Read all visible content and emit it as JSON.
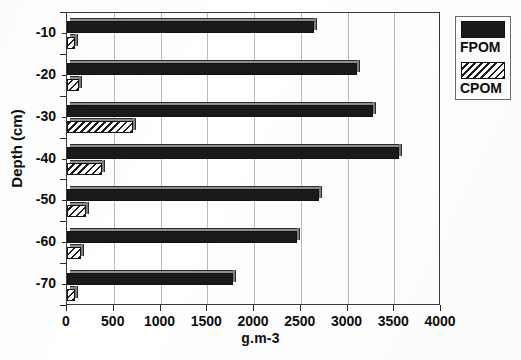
{
  "chart_data": {
    "type": "bar",
    "orientation": "horizontal",
    "title": "",
    "xlabel": "g.m-3",
    "ylabel": "Depth (cm)",
    "xlim": [
      0,
      4000
    ],
    "ylim": [
      -75,
      -5
    ],
    "xticks": [
      0,
      500,
      1000,
      1500,
      2000,
      2500,
      3000,
      3500,
      4000
    ],
    "xticklabels": [
      "0",
      "500",
      "1000",
      "1500",
      "2000",
      "2500",
      "3000",
      "3500",
      "4000"
    ],
    "categories": [
      -10,
      -20,
      -30,
      -40,
      -50,
      -60,
      -70
    ],
    "yticklabels": [
      "-10",
      "-20",
      "-30",
      "-40",
      "-50",
      "-60",
      "-70"
    ],
    "grid": "vertical",
    "legend_position": "outside-upper-right",
    "series": [
      {
        "name": "FPOM",
        "fill": "solid-black",
        "color": "#1a1a1a",
        "values": [
          2640,
          3100,
          3270,
          3550,
          2690,
          2460,
          1775
        ]
      },
      {
        "name": "CPOM",
        "fill": "diagonal-hatch",
        "color": "#1c1c1c",
        "values": [
          85,
          130,
          705,
          375,
          205,
          150,
          85
        ]
      }
    ]
  },
  "legend": {
    "entries": [
      {
        "label": "FPOM",
        "swatch": "solid"
      },
      {
        "label": "CPOM",
        "swatch": "hatch"
      }
    ]
  },
  "axes": {
    "x_title": "g.m-3",
    "y_title": "Depth (cm)"
  }
}
